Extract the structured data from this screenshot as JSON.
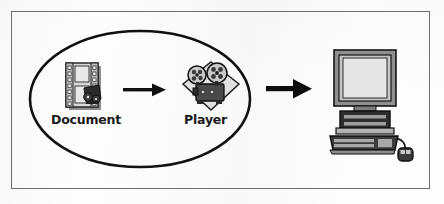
{
  "diagram": {
    "frame": {
      "border_color": "#6d6d6d",
      "background": "#ffffff"
    },
    "grouping": {
      "shape": "ellipse",
      "name": "authoring-group",
      "stroke_color": "#111111",
      "fill": "none"
    },
    "nodes": [
      {
        "id": "document",
        "label": "Document",
        "icon": "film-document-icon",
        "description": "film strip page with sprocket holes"
      },
      {
        "id": "player",
        "label": "Player",
        "icon": "movie-projector-icon",
        "description": "movie projector with two film reels on a diamond"
      },
      {
        "id": "computer",
        "label": "",
        "icon": "desktop-computer-icon",
        "description": "CRT monitor with keyboard and mouse"
      }
    ],
    "connectors": [
      {
        "id": "arrow-document-to-player",
        "from": "document",
        "to": "player",
        "style": "solid-arrow",
        "color": "#111111"
      },
      {
        "id": "arrow-player-to-computer",
        "from": "player",
        "to": "computer",
        "style": "solid-arrow-bold",
        "color": "#111111"
      }
    ],
    "palette": {
      "ink": "#111111",
      "icon_light": "#d9d9d9",
      "icon_mid": "#9a9a9a",
      "icon_dark": "#3a3a3a",
      "screen": "#e2e2e2"
    }
  }
}
